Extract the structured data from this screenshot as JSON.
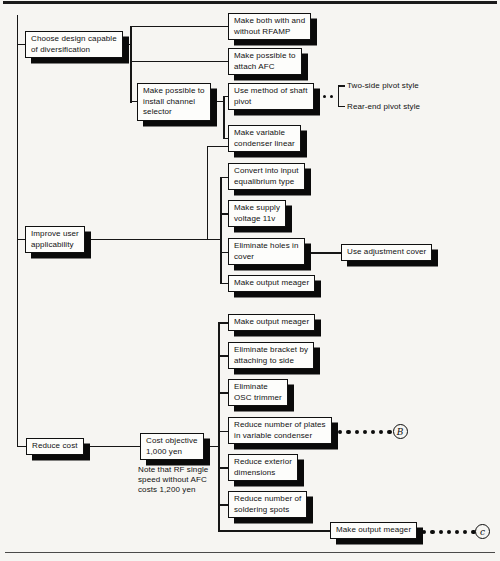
{
  "palette": {
    "page_background": "#f6f5f2",
    "box_background": "#fdfdfb",
    "box_border": "#101010",
    "box_shadow": "#0a0a0a",
    "line_color": "#161616"
  },
  "diagram": {
    "level1": {
      "choose": "Choose design capable\nof diversification",
      "improve": "Improve user\napplicability",
      "reduce": "Reduce cost"
    },
    "nodes": {
      "rfamp": "Make both with and\nwithout RFAMP",
      "afc": "Make possible to\nattach AFC",
      "channel": "Make possible to\ninstall channel\nselector",
      "shaft": "Use method of shaft\npivot",
      "varcond": "Make variable\ncondenser linear",
      "convert": "Convert into input\nequalibrium type",
      "supply": "Make supply\nvoltage 11v",
      "holes": "Eliminate holes in\ncover",
      "adjcover": "Use adjustment cover",
      "meager1": "Make output meager",
      "meager2": "Make output meager",
      "bracket": "Eliminate bracket by\nattaching to side",
      "osc": "Eliminate\nOSC trimmer",
      "plates": "Reduce number of plates\nin variable condenser",
      "exterior": "Reduce exterior\ndimensions",
      "soldering": "Reduce number of\nsoldering spots",
      "meager3": "Make output meager",
      "cost_objective": "Cost objective\n1,000 yen"
    },
    "pivot_styles": {
      "two_side": "Two-side pivot style",
      "rear_end": "Rear-end pivot style"
    },
    "cost_note": "Note that RF single\nspeed without AFC\ncosts 1,200 yen",
    "refs": {
      "b": "B",
      "c": "c"
    }
  }
}
